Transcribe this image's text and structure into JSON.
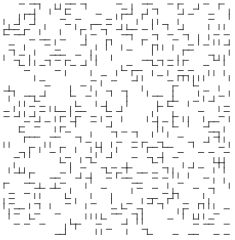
{
  "figure": {
    "type": "maze-grid-diagram",
    "title": "",
    "width": 235,
    "height": 240,
    "background_color": "#ffffff",
    "line_color": "#3c3c3c",
    "line_width": 0.9
  },
  "grid": {
    "origin_x": 4,
    "origin_y": 4,
    "cell_size": 5.12,
    "cols": 44,
    "rows": 45,
    "description": "uniform square lattice of grid lines"
  },
  "carved_region": {
    "description": "interior blob where lattice edges have been removed, leaving a sparse spanning-tree of remaining wall segments",
    "seed": 20250617,
    "noise_scale": 0.115,
    "threshold": 0.055,
    "tree_density": 0.155,
    "blob_center_x": 0.52,
    "blob_center_y": 0.46,
    "blob_radius_x": 0.395,
    "blob_radius_y": 0.4,
    "edge_roughness": 0.3
  },
  "legend": {
    "visible": false,
    "entries": []
  },
  "axes": {
    "visible": false,
    "xlabel": "",
    "ylabel": "",
    "ticks": []
  }
}
